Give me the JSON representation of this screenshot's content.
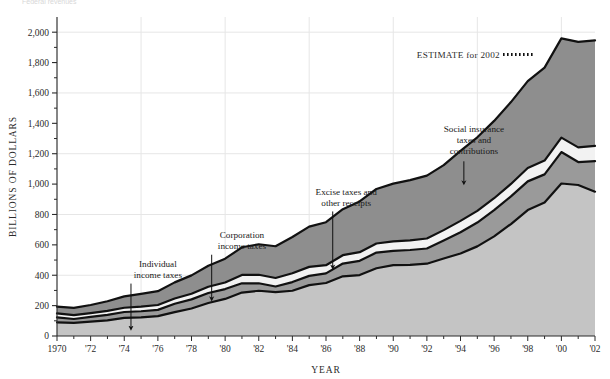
{
  "top_note": "Federal revenues",
  "chart_data": {
    "type": "area",
    "stacked": true,
    "title": "",
    "xlabel": "YEAR",
    "ylabel": "BILLIONS OF DOLLARS",
    "xlim": [
      1970,
      2002
    ],
    "ylim": [
      0,
      2100
    ],
    "ytick_values": [
      0,
      200,
      400,
      600,
      800,
      1000,
      1200,
      1400,
      1600,
      1800,
      2000
    ],
    "ytick_labels": [
      "0",
      "200",
      "400",
      "600",
      "800",
      "1,000",
      "1,200",
      "1,400",
      "1,600",
      "1,800",
      "2,000"
    ],
    "xtick_values": [
      1970,
      1972,
      1974,
      1976,
      1978,
      1980,
      1982,
      1984,
      1986,
      1988,
      1990,
      1992,
      1994,
      1996,
      1998,
      2000,
      2002
    ],
    "xtick_labels": [
      "1970",
      "'72",
      "'74",
      "'76",
      "'78",
      "'80",
      "'82",
      "'84",
      "'86",
      "'88",
      "'90",
      "'92",
      "'94",
      "'96",
      "'98",
      "'00",
      "'02"
    ],
    "xminor_step": 1,
    "grid": {
      "horizontal_at": [
        400,
        800,
        1200,
        1600,
        2000
      ],
      "vertical_at": [
        1970,
        1975,
        1980,
        1985,
        1990,
        1995,
        2000
      ],
      "color": "#e6e6e6"
    },
    "x": [
      1970,
      1971,
      1972,
      1973,
      1974,
      1975,
      1976,
      1977,
      1978,
      1979,
      1980,
      1981,
      1982,
      1983,
      1984,
      1985,
      1986,
      1987,
      1988,
      1989,
      1990,
      1991,
      1992,
      1993,
      1994,
      1995,
      1996,
      1997,
      1998,
      1999,
      2000,
      2001,
      2002
    ],
    "series": [
      {
        "name": "Individual income taxes",
        "color": "#c4c4c4",
        "values": [
          90,
          86,
          94,
          103,
          119,
          122,
          131,
          157,
          181,
          217,
          244,
          286,
          298,
          289,
          298,
          335,
          349,
          393,
          401,
          446,
          467,
          468,
          476,
          510,
          543,
          590,
          656,
          737,
          829,
          879,
          1004,
          994,
          950
        ]
      },
      {
        "name": "Corporation income taxes",
        "color": "#9a9a9a",
        "values": [
          33,
          26,
          32,
          36,
          39,
          41,
          41,
          55,
          60,
          66,
          65,
          61,
          49,
          37,
          57,
          61,
          63,
          84,
          94,
          103,
          94,
          98,
          100,
          118,
          140,
          157,
          172,
          182,
          189,
          185,
          207,
          151,
          201
        ]
      },
      {
        "name": "Excise taxes and other receipts",
        "color": "#f2f2f2",
        "values": [
          26,
          25,
          25,
          26,
          28,
          30,
          32,
          35,
          37,
          41,
          43,
          55,
          56,
          56,
          58,
          59,
          54,
          55,
          57,
          60,
          62,
          64,
          66,
          69,
          75,
          77,
          79,
          82,
          88,
          91,
          95,
          97,
          100
        ]
      },
      {
        "name": "Social insurance taxes and contributions",
        "color": "#8e8e8e",
        "values": [
          44,
          48,
          53,
          64,
          75,
          84,
          91,
          106,
          121,
          138,
          157,
          182,
          201,
          209,
          239,
          265,
          283,
          303,
          334,
          359,
          380,
          396,
          414,
          428,
          461,
          484,
          509,
          539,
          572,
          612,
          653,
          694,
          695
        ]
      }
    ],
    "band_edge_color": "#111111",
    "estimate": {
      "label": "ESTIMATE for 2002",
      "year": 2002,
      "style": "dotted",
      "color": "#111111"
    },
    "annotations": [
      {
        "id": "individual-income-taxes",
        "lines": [
          "Individual",
          "income taxes"
        ],
        "text_x": 1976.0,
        "text_y": 455,
        "arrow_x": 1974.4,
        "arrow_from_y": 345,
        "arrow_to_y": 48
      },
      {
        "id": "corporation-income-taxes",
        "lines": [
          "Corporation",
          "income taxes"
        ],
        "text_x": 1981.0,
        "text_y": 645,
        "arrow_x": 1979.2,
        "arrow_from_y": 535,
        "arrow_to_y": 240
      },
      {
        "id": "excise-taxes-and-other-receipts",
        "lines": [
          "Excise taxes and",
          "other receipts"
        ],
        "text_x": 1987.2,
        "text_y": 925,
        "arrow_x": 1986.4,
        "arrow_from_y": 820,
        "arrow_to_y": 450
      },
      {
        "id": "social-insurance-taxes-and-contributions",
        "lines": [
          "Social insurance",
          "taxes and",
          "contributions"
        ],
        "text_x": 1994.8,
        "text_y": 1340,
        "arrow_x": 1994.2,
        "arrow_from_y": 1150,
        "arrow_to_y": 1005
      }
    ]
  }
}
